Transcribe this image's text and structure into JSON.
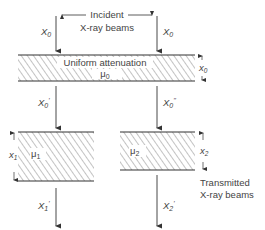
{
  "incident": {
    "title_line1": "Incident",
    "title_line2": "X-ray beams",
    "left_beam_label": "X",
    "left_beam_sub": "0",
    "right_beam_label": "X",
    "right_beam_sub": "0"
  },
  "top_slab": {
    "label": "Uniform attenuation",
    "coef": "μ",
    "coef_sub": "0",
    "thickness_label": "x",
    "thickness_sub": "0"
  },
  "intermediate": {
    "left_label": "X",
    "left_sub": "0",
    "left_prime": "'",
    "right_label": "X",
    "right_sub": "0",
    "right_prime": "''"
  },
  "left_slab": {
    "coef": "μ",
    "coef_sub": "1",
    "thickness_label": "x",
    "thickness_sub": "1"
  },
  "right_slab": {
    "coef": "μ",
    "coef_sub": "2",
    "thickness_label": "x",
    "thickness_sub": "2"
  },
  "transmitted": {
    "title_line1": "Transmitted",
    "title_line2": "X-ray beams",
    "left_label": "X",
    "left_sub": "1",
    "left_prime": "'",
    "right_label": "X",
    "right_sub": "2",
    "right_prime": "'"
  }
}
